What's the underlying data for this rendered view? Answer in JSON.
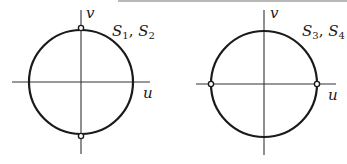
{
  "figure": {
    "panels": [
      {
        "id": "left",
        "axis_labels": {
          "horizontal": "u",
          "vertical": "v"
        },
        "label_main_1": "S",
        "label_sub_1": "1",
        "label_sep": ", ",
        "label_main_2": "S",
        "label_sub_2": "2",
        "marked_points": [
          "top",
          "bottom"
        ]
      },
      {
        "id": "right",
        "axis_labels": {
          "horizontal": "u",
          "vertical": "v"
        },
        "label_main_1": "S",
        "label_sub_1": "3",
        "label_sep": ", ",
        "label_main_2": "S",
        "label_sub_2": "4",
        "marked_points": [
          "left",
          "right"
        ]
      }
    ],
    "colors": {
      "stroke": "#1a1a1a",
      "axis": "#333333",
      "border": "#9a9a9a"
    }
  }
}
